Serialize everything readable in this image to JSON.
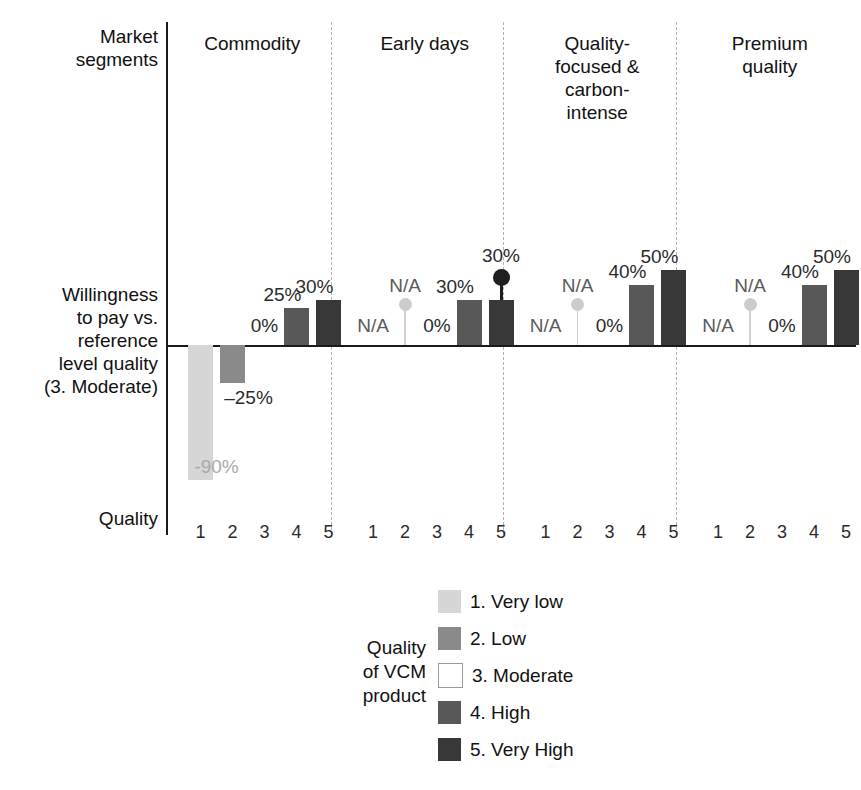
{
  "labels": {
    "market_segments": "Market\nsegments",
    "willingness": "Willingness\nto pay vs.\nreference\nlevel quality\n(3. Moderate)",
    "quality_row": "Quality"
  },
  "legend": {
    "title": "Quality\nof VCM\nproduct",
    "items": [
      {
        "label": "1. Very low",
        "color": "#d6d6d6"
      },
      {
        "label": "2. Low",
        "color": "#8a8a8a"
      },
      {
        "label": "3. Moderate",
        "color": "#ffffff"
      },
      {
        "label": "4. High",
        "color": "#585858"
      },
      {
        "label": "5. Very High",
        "color": "#383838"
      }
    ]
  },
  "chart_data": {
    "type": "bar",
    "title": "",
    "xlabel": "Quality",
    "ylabel": "Willingness to pay vs. reference level quality (3. Moderate)",
    "grid": false,
    "legend_position": "bottom-center",
    "ylim": [
      -100,
      55
    ],
    "quality_levels": [
      "1",
      "2",
      "3",
      "4",
      "5"
    ],
    "series_colors": [
      "#d6d6d6",
      "#8a8a8a",
      "#ffffff",
      "#585858",
      "#383838"
    ],
    "groups": [
      {
        "name": "Commodity",
        "points": [
          {
            "quality": "1",
            "value": -90,
            "label": "-90%",
            "kind": "bar",
            "label_color": "faint"
          },
          {
            "quality": "2",
            "value": -25,
            "label": "–25%",
            "kind": "bar",
            "label_color": "dark"
          },
          {
            "quality": "3",
            "value": 0,
            "label": "0%",
            "kind": "zero",
            "label_color": "dark"
          },
          {
            "quality": "4",
            "value": 25,
            "label": "25%",
            "kind": "bar",
            "label_color": "dark"
          },
          {
            "quality": "5",
            "value": 30,
            "label": "30%",
            "kind": "bar",
            "label_color": "dark"
          }
        ]
      },
      {
        "name": "Early days",
        "points": [
          {
            "quality": "1",
            "value": null,
            "label": "N/A",
            "kind": "na-flat",
            "label_color": "mid"
          },
          {
            "quality": "2",
            "value": null,
            "label": "N/A",
            "kind": "na-pin",
            "label_color": "mid"
          },
          {
            "quality": "3",
            "value": 0,
            "label": "0%",
            "kind": "zero",
            "label_color": "dark"
          },
          {
            "quality": "4",
            "value": 30,
            "label": "30%",
            "kind": "bar",
            "label_color": "dark"
          },
          {
            "quality": "5",
            "value": 30,
            "label": "30%",
            "kind": "bar-marker",
            "marker_value": 45,
            "label_color": "dark"
          }
        ]
      },
      {
        "name": "Quality-\nfocused &\ncarbon-\nintense",
        "points": [
          {
            "quality": "1",
            "value": null,
            "label": "N/A",
            "kind": "na-flat",
            "label_color": "mid"
          },
          {
            "quality": "2",
            "value": null,
            "label": "N/A",
            "kind": "na-pin",
            "label_color": "mid"
          },
          {
            "quality": "3",
            "value": 0,
            "label": "0%",
            "kind": "zero",
            "label_color": "dark"
          },
          {
            "quality": "4",
            "value": 40,
            "label": "40%",
            "kind": "bar",
            "label_color": "dark"
          },
          {
            "quality": "5",
            "value": 50,
            "label": "50%",
            "kind": "bar",
            "label_color": "dark"
          }
        ]
      },
      {
        "name": "Premium\nquality",
        "points": [
          {
            "quality": "1",
            "value": null,
            "label": "N/A",
            "kind": "na-flat",
            "label_color": "mid"
          },
          {
            "quality": "2",
            "value": null,
            "label": "N/A",
            "kind": "na-pin",
            "label_color": "mid"
          },
          {
            "quality": "3",
            "value": 0,
            "label": "0%",
            "kind": "zero",
            "label_color": "dark"
          },
          {
            "quality": "4",
            "value": 40,
            "label": "40%",
            "kind": "bar",
            "label_color": "dark"
          },
          {
            "quality": "5",
            "value": 50,
            "label": "50%",
            "kind": "bar",
            "label_color": "dark"
          }
        ]
      }
    ]
  }
}
